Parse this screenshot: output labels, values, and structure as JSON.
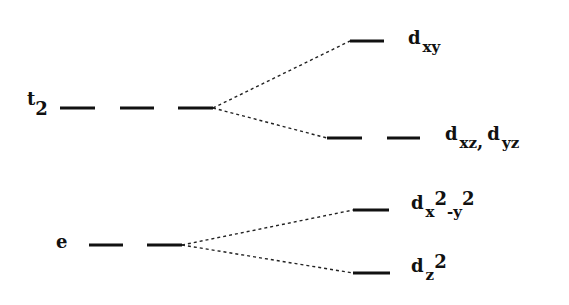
{
  "diagram": {
    "groups": [
      {
        "id": "t2",
        "label": {
          "main": "t",
          "sub": "2"
        },
        "degeneracy": 3,
        "splits_into": [
          "dxy",
          "dxz_dyz"
        ]
      },
      {
        "id": "e",
        "label": {
          "main": "e",
          "sub": ""
        },
        "degeneracy": 2,
        "splits_into": [
          "dx2y2",
          "dz2"
        ]
      }
    ],
    "levels": [
      {
        "id": "dxy",
        "degeneracy": 1,
        "label_parts": [
          {
            "t": "d",
            "k": "main"
          },
          {
            "t": "xy",
            "k": "sub"
          }
        ]
      },
      {
        "id": "dxz_dyz",
        "degeneracy": 2,
        "label_parts": [
          {
            "t": "d",
            "k": "main"
          },
          {
            "t": "xz",
            "k": "sub"
          },
          {
            "t": ", ",
            "k": "main"
          },
          {
            "t": "d",
            "k": "main"
          },
          {
            "t": "yz",
            "k": "sub"
          }
        ]
      },
      {
        "id": "dx2y2",
        "degeneracy": 1,
        "label_parts": [
          {
            "t": "d",
            "k": "main"
          },
          {
            "t": "x",
            "k": "sub"
          },
          {
            "t": "2",
            "k": "sup"
          },
          {
            "t": "-y",
            "k": "sub"
          },
          {
            "t": "2",
            "k": "sup"
          }
        ]
      },
      {
        "id": "dz2",
        "degeneracy": 1,
        "label_parts": [
          {
            "t": "d",
            "k": "main"
          },
          {
            "t": "z",
            "k": "sub"
          },
          {
            "t": "2",
            "k": "sup"
          }
        ]
      }
    ],
    "labels": {
      "t2_main": "t",
      "t2_sub": "2",
      "e_main": "e",
      "dxy_d": "d",
      "dxy_sub": "xy",
      "dxz_d": "d",
      "dxz_sub": "xz",
      "comma": ",",
      "dyz_d": "d",
      "dyz_sub": "yz",
      "dx2y2_d": "d",
      "dx2y2_x": "x",
      "dx2y2_sup1": "2",
      "dx2y2_y": "-y",
      "dx2y2_sup2": "2",
      "dz2_d": "d",
      "dz2_z": "z",
      "dz2_sup": "2"
    }
  }
}
